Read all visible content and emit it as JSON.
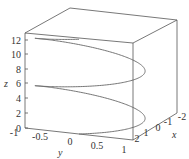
{
  "chart_data": {
    "type": "line3d",
    "title": "",
    "xlabel": "x",
    "ylabel": "y",
    "zlabel": "z",
    "x_ticks": [
      "-2",
      "-1",
      "0",
      "1",
      "2"
    ],
    "y_ticks": [
      "-1",
      "-0.5",
      "0",
      "0.5",
      "1"
    ],
    "z_ticks": [
      "0",
      "2",
      "4",
      "6",
      "8",
      "10",
      "12"
    ],
    "xlim": [
      -2,
      2
    ],
    "ylim": [
      -1,
      1
    ],
    "zlim": [
      0,
      12.6
    ],
    "grid": false,
    "box": true,
    "series": [
      {
        "name": "helix",
        "param": "t",
        "t_range": [
          0,
          12.566
        ],
        "x": "1 - cos(t) (approx, range 0..2)",
        "y": "sin(t)",
        "z": "t"
      }
    ],
    "colors": {
      "curve": "#666666",
      "box": "#555555",
      "text": "#333333"
    }
  },
  "axes": {
    "x_label": "x",
    "y_label": "y",
    "z_label": "z",
    "x_ticks": [
      {
        "label": "-2",
        "px": 182,
        "py": 120
      },
      {
        "label": "-1",
        "px": 168,
        "py": 125
      },
      {
        "label": "0",
        "px": 158,
        "py": 131
      },
      {
        "label": "1",
        "px": 146,
        "py": 136
      },
      {
        "label": "2",
        "px": 137,
        "py": 142
      }
    ],
    "y_ticks": [
      {
        "label": "-1",
        "px": 14,
        "py": 136
      },
      {
        "label": "-0.5",
        "px": 40,
        "py": 140
      },
      {
        "label": "0",
        "px": 70,
        "py": 145
      },
      {
        "label": "0.5",
        "px": 97,
        "py": 149
      },
      {
        "label": "1",
        "px": 124,
        "py": 153
      }
    ],
    "z_ticks": [
      {
        "label": "0",
        "py": 128
      },
      {
        "label": "2",
        "py": 113
      },
      {
        "label": "4",
        "py": 98
      },
      {
        "label": "6",
        "py": 83
      },
      {
        "label": "8",
        "py": 69
      },
      {
        "label": "10",
        "py": 54
      },
      {
        "label": "12",
        "py": 40
      }
    ]
  }
}
